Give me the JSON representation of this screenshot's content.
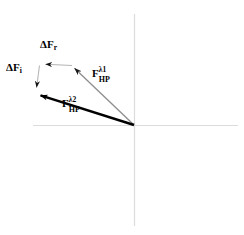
{
  "figure": {
    "background_color": "#ffffff",
    "width": 244,
    "height": 235
  },
  "axes": {
    "name": "cartesian-axes",
    "color": "#d8d8d8",
    "origin": {
      "x": 134,
      "y": 125
    },
    "horizontal": {
      "x1": 33,
      "y1": 125,
      "x2": 238,
      "y2": 125
    },
    "vertical": {
      "x1": 134,
      "y1": 14,
      "x2": 134,
      "y2": 226
    }
  },
  "vectors": [
    {
      "id": "f-hp-lambda1",
      "label_plain": "F_HP^λ1",
      "symbol": "F",
      "superscript": "λ1",
      "subscript": "HP",
      "color": "#808080",
      "stroke_width": 1.4,
      "from": {
        "x": 134,
        "y": 125
      },
      "to": {
        "x": 72,
        "y": 66
      },
      "label_position": {
        "x": 92,
        "y": 68
      }
    },
    {
      "id": "f-hp-lambda2",
      "label_plain": "F_HP^λ2",
      "symbol": "F",
      "superscript": "λ2",
      "subscript": "HP",
      "color": "#000000",
      "stroke_width": 2.6,
      "from": {
        "x": 134,
        "y": 125
      },
      "to": {
        "x": 36,
        "y": 94
      },
      "label_position": {
        "x": 62,
        "y": 98
      }
    },
    {
      "id": "delta-f-r",
      "label_plain": "ΔF_r",
      "symbol": "ΔF",
      "superscript": "",
      "subscript": "r",
      "color": "#a8a8a8",
      "stroke_width": 1.1,
      "from": {
        "x": 72,
        "y": 66
      },
      "to": {
        "x": 40,
        "y": 64
      },
      "label_position": {
        "x": 40,
        "y": 39
      }
    },
    {
      "id": "delta-f-i",
      "label_plain": "ΔF_i",
      "symbol": "ΔF",
      "superscript": "",
      "subscript": "i",
      "color": "#a8a8a8",
      "stroke_width": 1.1,
      "from": {
        "x": 39,
        "y": 65
      },
      "to": {
        "x": 36,
        "y": 92
      },
      "label_position": {
        "x": 6,
        "y": 62
      }
    }
  ],
  "labels": {
    "delta_f_r": {
      "symbol": "ΔF",
      "subscript": "r"
    },
    "delta_f_i": {
      "symbol": "ΔF",
      "subscript": "i"
    },
    "f_hp_lambda1": {
      "symbol": "F",
      "superscript": "λ1",
      "subscript": "HP"
    },
    "f_hp_lambda2": {
      "symbol": "F",
      "superscript": "λ2",
      "subscript": "HP"
    }
  }
}
